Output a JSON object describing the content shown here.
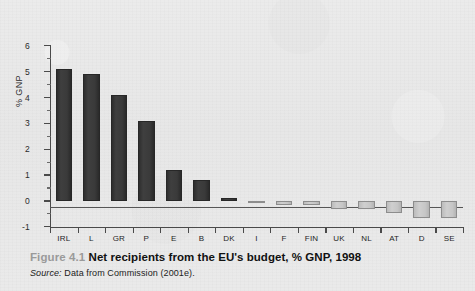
{
  "figure": {
    "number_label": "Figure 4.1",
    "title": "Net recipients from the EU's budget, % GNP, 1998",
    "source_label": "Source:",
    "source_text": "Data from Commission (2001e)."
  },
  "chart_data": {
    "type": "bar",
    "title": "Net recipients from the EU's budget, % GNP, 1998",
    "xlabel": "",
    "ylabel": "% GNP",
    "categories": [
      "IRL",
      "L",
      "GR",
      "P",
      "E",
      "B",
      "DK",
      "I",
      "F",
      "FIN",
      "UK",
      "NL",
      "AT",
      "D",
      "SE"
    ],
    "values": [
      5.1,
      4.9,
      4.1,
      3.1,
      1.2,
      0.8,
      0.1,
      -0.02,
      -0.15,
      -0.15,
      -0.33,
      -0.33,
      -0.45,
      -0.65,
      -0.65
    ],
    "ylim": [
      -1,
      6
    ],
    "ytick_labels": [
      "6",
      "5",
      "4",
      "3",
      "2",
      "1",
      "0",
      "-1"
    ],
    "ytick_values": [
      6,
      5,
      4,
      3,
      2,
      1,
      0,
      -1
    ],
    "minor_tick_step": 0.5,
    "grid": false,
    "legend": "none",
    "positive_bar_color": "#3a3a3a",
    "negative_bar_color": "#c6c6c6",
    "axis_color": "#4a4a4a",
    "background_color": "#e9e9e9"
  }
}
